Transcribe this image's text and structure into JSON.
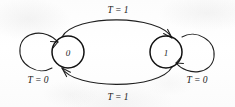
{
  "figure": {
    "type": "state-transition-diagram",
    "background_color": "#fdfdfd",
    "ink_color": "#1a1a1a",
    "states": [
      {
        "id": "state-0",
        "label": "0",
        "cx": 68,
        "cy": 52,
        "r": 16
      },
      {
        "id": "state-1",
        "label": "1",
        "cx": 166,
        "cy": 52,
        "r": 16
      }
    ],
    "transitions": [
      {
        "id": "self-loop-zero",
        "from": "0",
        "to": "0",
        "label": "T = 0",
        "label_x": 38,
        "label_y": 80,
        "kind": "self-loop",
        "side": "left"
      },
      {
        "id": "self-loop-one",
        "from": "1",
        "to": "1",
        "label": "T = 0",
        "label_x": 197,
        "label_y": 80,
        "kind": "self-loop",
        "side": "right"
      },
      {
        "id": "zero-to-one",
        "from": "0",
        "to": "1",
        "label": "T = 1",
        "label_x": 118,
        "label_y": 10,
        "kind": "arc",
        "side": "top"
      },
      {
        "id": "one-to-zero",
        "from": "1",
        "to": "0",
        "label": "T = 1",
        "label_x": 118,
        "label_y": 97,
        "kind": "arc",
        "side": "bottom"
      }
    ]
  }
}
